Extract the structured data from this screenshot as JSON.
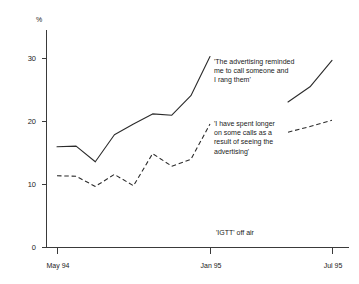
{
  "chart_data": {
    "type": "line",
    "title": "",
    "xlabel": "",
    "ylabel": "%",
    "ylim": [
      0,
      33
    ],
    "xlim": [
      "May 94",
      "Jul 95"
    ],
    "grid": false,
    "legend": "annotations-inline",
    "y_ticks": [
      0,
      10,
      20,
      30
    ],
    "y_tick_labels": [
      "0",
      "10",
      "20",
      "30"
    ],
    "x_ticks": [
      "May 94",
      "Jan 95",
      "Jul 95"
    ],
    "x_tick_labels": [
      "May 94",
      "Jan 95",
      "Jul 95"
    ],
    "axis_unit_label": "%",
    "event_note": "'IGTT' off air",
    "series": [
      {
        "name": "'The advertising reminded me to call someone and I rang them'",
        "style": "solid",
        "annotation_lines": [
          "'The advertising reminded",
          "me to call someone and",
          "I rang them'"
        ],
        "x": [
          "May 94",
          "Jun 94",
          "Jul 94",
          "Aug 94",
          "Sep 94",
          "Oct 94",
          "Nov 94",
          "Dec 94",
          "Jan 95",
          "May 95",
          "Jun 95",
          "Jul 95"
        ],
        "values": [
          16.0,
          16.1,
          13.6,
          17.9,
          19.6,
          21.2,
          21.0,
          24.1,
          30.3,
          23.1,
          25.5,
          29.7
        ],
        "gap_after": "Jan 95"
      },
      {
        "name": "'I have spent longer on some calls as a result of seeing the advertising'",
        "style": "dashed",
        "annotation_lines": [
          "'I have spent longer",
          "on some calls as a",
          "result of seeing the",
          "advertising'"
        ],
        "x": [
          "May 94",
          "Jun 94",
          "Jul 94",
          "Aug 94",
          "Sep 94",
          "Oct 94",
          "Nov 94",
          "Dec 94",
          "Jan 95",
          "May 95",
          "Jun 95",
          "Jul 95"
        ],
        "values": [
          11.4,
          11.3,
          9.7,
          11.6,
          9.8,
          14.9,
          12.9,
          14.0,
          19.6,
          18.3,
          19.2,
          20.2
        ],
        "gap_after": "Jan 95"
      }
    ]
  },
  "axis": {
    "unit": "%",
    "y_labels": [
      "30",
      "20",
      "10",
      "0"
    ],
    "x_labels": [
      "May 94",
      "Jan 95",
      "Jul 95"
    ]
  },
  "annotations": {
    "solid": {
      "line1": "'The advertising reminded",
      "line2": "me to call someone and",
      "line3": "I rang them'"
    },
    "dashed": {
      "line1": "'I have spent longer",
      "line2": "on some calls as a",
      "line3": "result of seeing the",
      "line4": "advertising'"
    },
    "event": "'IGTT' off air"
  },
  "colors": {
    "line": "#2b2b2b",
    "axis": "#3a3a3a",
    "background": "#ffffff",
    "text": "#1a1a1a"
  }
}
